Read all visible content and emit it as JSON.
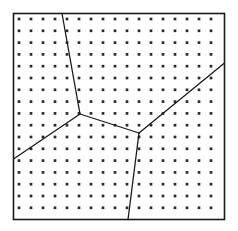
{
  "figure": {
    "type": "geometric-diagram",
    "canvas": {
      "width": 238,
      "height": 231,
      "background": "#ffffff"
    }
  },
  "frame": {
    "name": "square-border",
    "x": 13.5,
    "y": 13.5,
    "width": 211,
    "height": 206,
    "stroke": "#1a1a1a",
    "stroke_width": 1.6,
    "fill": "#ffffff"
  },
  "lattice": {
    "name": "dot-grid",
    "columns": 17,
    "rows": 17,
    "origin_x": 19,
    "origin_y": 19,
    "spacing_x": 12,
    "spacing_y": 11.8,
    "dot_radius": 1.35,
    "dot_color": "#2b2b2b"
  },
  "vertices": [
    {
      "id": "j1",
      "label": "triple-junction-upper-left",
      "x": 80,
      "y": 114
    },
    {
      "id": "j2",
      "label": "triple-junction-lower-right",
      "x": 139,
      "y": 133
    }
  ],
  "boundary_points": [
    {
      "id": "b_top",
      "label": "top-edge-endpoint",
      "x": 62,
      "y": 13.5
    },
    {
      "id": "b_left",
      "label": "left-edge-endpoint",
      "x": 13.5,
      "y": 159
    },
    {
      "id": "b_bottom",
      "label": "bottom-edge-endpoint",
      "x": 128,
      "y": 219.5
    },
    {
      "id": "b_right",
      "label": "right-edge-endpoint",
      "x": 224.5,
      "y": 63
    }
  ],
  "edges": [
    {
      "id": "e1",
      "label": "edge-top-to-j1",
      "from": "b_top",
      "to": "j1",
      "x1": 62,
      "y1": 13.5,
      "x2": 80,
      "y2": 114
    },
    {
      "id": "e2",
      "label": "edge-j1-to-left",
      "from": "j1",
      "to": "b_left",
      "x1": 80,
      "y1": 114,
      "x2": 13.5,
      "y2": 159
    },
    {
      "id": "e3",
      "label": "edge-j1-to-j2",
      "from": "j1",
      "to": "j2",
      "x1": 80,
      "y1": 114,
      "x2": 139,
      "y2": 133
    },
    {
      "id": "e4",
      "label": "edge-j2-to-bottom",
      "from": "j2",
      "to": "b_bottom",
      "x1": 139,
      "y1": 133,
      "x2": 128,
      "y2": 219.5
    },
    {
      "id": "e5",
      "label": "edge-j2-to-right",
      "from": "j2",
      "to": "b_right",
      "x1": 139,
      "y1": 133,
      "x2": 224.5,
      "y2": 63
    }
  ],
  "edge_style": {
    "stroke": "#1a1a1a",
    "stroke_width": 1.3
  },
  "regions": [
    {
      "id": "r1",
      "label": "region-upper-left"
    },
    {
      "id": "r2",
      "label": "region-upper-right"
    },
    {
      "id": "r3",
      "label": "region-lower-left"
    },
    {
      "id": "r4",
      "label": "region-lower-right"
    }
  ],
  "counts": {
    "regions": 4,
    "junctions": 2,
    "edges": 5,
    "dots": 289
  }
}
